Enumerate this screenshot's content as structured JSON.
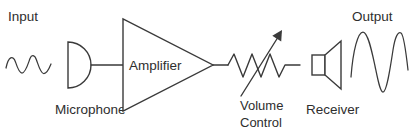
{
  "diagram": {
    "title_input": "Input",
    "title_output": "Output",
    "blocks": {
      "microphone": {
        "label": "Microphone",
        "icon": "microphone-symbol"
      },
      "amplifier": {
        "label": "Amplifier",
        "icon": "amplifier-triangle-symbol"
      },
      "volume_control": {
        "label_line1": "Volume",
        "label_line2": "Control",
        "icon": "variable-resistor-symbol"
      },
      "receiver": {
        "label": "Receiver",
        "icon": "speaker-symbol"
      }
    },
    "waveforms": {
      "input": {
        "name": "input-waveform",
        "cycles": 2,
        "amplitude": "small"
      },
      "output": {
        "name": "output-waveform",
        "cycles": 2,
        "amplitude": "large"
      }
    },
    "colors": {
      "stroke": "#3a3a3a",
      "text": "#2e2e2e",
      "background": "#ffffff"
    }
  }
}
